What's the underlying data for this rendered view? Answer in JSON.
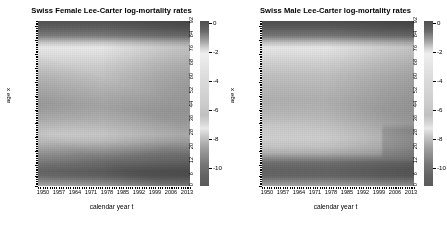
{
  "chart_data": [
    {
      "type": "heatmap",
      "title": "Swiss Female Lee-Carter log-mortality rates",
      "xlabel": "calendar year t",
      "ylabel": "age x",
      "xticks": [
        1950,
        1957,
        1964,
        1971,
        1978,
        1985,
        1992,
        1999,
        2006,
        2013
      ],
      "yticks": [
        0,
        6,
        12,
        20,
        28,
        36,
        44,
        52,
        60,
        68,
        76,
        84,
        92
      ],
      "xlim": [
        1950,
        2016
      ],
      "ylim": [
        0,
        95
      ],
      "zlim": [
        -11,
        0.5
      ],
      "colorbar": {
        "ticks": [
          0,
          -2,
          -4,
          -6,
          -8,
          -10
        ],
        "label": "",
        "position": "right",
        "scale": "log-mortality"
      },
      "grid": false,
      "age_profile": [
        {
          "age": 0,
          "logmu_1950": -4.3,
          "logmu_2016": -6.5
        },
        {
          "age": 6,
          "logmu_1950": -7.8,
          "logmu_2016": -9.6
        },
        {
          "age": 12,
          "logmu_1950": -8.1,
          "logmu_2016": -9.9
        },
        {
          "age": 20,
          "logmu_1950": -7.4,
          "logmu_2016": -9.0
        },
        {
          "age": 28,
          "logmu_1950": -7.2,
          "logmu_2016": -8.7
        },
        {
          "age": 36,
          "logmu_1950": -6.6,
          "logmu_2016": -8.1
        },
        {
          "age": 44,
          "logmu_1950": -5.8,
          "logmu_2016": -7.1
        },
        {
          "age": 52,
          "logmu_1950": -5.0,
          "logmu_2016": -6.1
        },
        {
          "age": 60,
          "logmu_1950": -4.2,
          "logmu_2016": -5.2
        },
        {
          "age": 68,
          "logmu_1950": -3.4,
          "logmu_2016": -4.3
        },
        {
          "age": 76,
          "logmu_1950": -2.5,
          "logmu_2016": -3.3
        },
        {
          "age": 84,
          "logmu_1950": -1.6,
          "logmu_2016": -2.2
        },
        {
          "age": 92,
          "logmu_1950": -0.8,
          "logmu_2016": -1.2
        }
      ]
    },
    {
      "type": "heatmap",
      "title": "Swiss Male Lee-Carter log-mortality rates",
      "xlabel": "calendar year t",
      "ylabel": "age x",
      "xticks": [
        1950,
        1957,
        1964,
        1971,
        1978,
        1985,
        1992,
        1999,
        2006,
        2013
      ],
      "yticks": [
        0,
        6,
        12,
        20,
        28,
        36,
        44,
        52,
        60,
        68,
        76,
        84,
        92
      ],
      "xlim": [
        1950,
        2016
      ],
      "ylim": [
        0,
        95
      ],
      "zlim": [
        -11,
        0.5
      ],
      "colorbar": {
        "ticks": [
          0,
          -2,
          -4,
          -6,
          -8,
          -10
        ],
        "label": "",
        "position": "right",
        "scale": "log-mortality"
      },
      "grid": false,
      "age_profile": [
        {
          "age": 0,
          "logmu_1950": -4.0,
          "logmu_2016": -6.2
        },
        {
          "age": 6,
          "logmu_1950": -7.5,
          "logmu_2016": -9.3
        },
        {
          "age": 12,
          "logmu_1950": -7.9,
          "logmu_2016": -9.5
        },
        {
          "age": 20,
          "logmu_1950": -6.7,
          "logmu_2016": -8.2
        },
        {
          "age": 28,
          "logmu_1950": -6.6,
          "logmu_2016": -8.1
        },
        {
          "age": 36,
          "logmu_1950": -6.2,
          "logmu_2016": -7.6
        },
        {
          "age": 44,
          "logmu_1950": -5.5,
          "logmu_2016": -6.8
        },
        {
          "age": 52,
          "logmu_1950": -4.7,
          "logmu_2016": -5.8
        },
        {
          "age": 60,
          "logmu_1950": -3.9,
          "logmu_2016": -4.9
        },
        {
          "age": 68,
          "logmu_1950": -3.1,
          "logmu_2016": -4.0
        },
        {
          "age": 76,
          "logmu_1950": -2.3,
          "logmu_2016": -3.0
        },
        {
          "age": 84,
          "logmu_1950": -1.5,
          "logmu_2016": -2.0
        },
        {
          "age": 92,
          "logmu_1950": -0.7,
          "logmu_2016": -1.1
        }
      ]
    }
  ],
  "panels": [
    {
      "id": "female",
      "title": "Swiss Female Lee-Carter log-mortality rates",
      "xlabel": "calendar year t",
      "ylabel": "age x",
      "xticks": [
        "1950",
        "1957",
        "1964",
        "1971",
        "1978",
        "1985",
        "1992",
        "1999",
        "2006",
        "2013"
      ],
      "yticks": [
        "0",
        "6",
        "12",
        "20",
        "28",
        "36",
        "44",
        "52",
        "60",
        "68",
        "76",
        "84",
        "92"
      ],
      "cbticks": [
        "0",
        "-2",
        "-4",
        "-6",
        "-8",
        "-10"
      ]
    },
    {
      "id": "male",
      "title": "Swiss Male Lee-Carter log-mortality rates",
      "xlabel": "calendar year t",
      "ylabel": "age x",
      "xticks": [
        "1950",
        "1957",
        "1964",
        "1971",
        "1978",
        "1985",
        "1992",
        "1999",
        "2006",
        "2013"
      ],
      "yticks": [
        "0",
        "6",
        "12",
        "20",
        "28",
        "36",
        "44",
        "52",
        "60",
        "68",
        "76",
        "84",
        "92"
      ],
      "cbticks": [
        "0",
        "-2",
        "-4",
        "-6",
        "-8",
        "-10"
      ]
    }
  ],
  "colors": {
    "background": "#ffffff",
    "text": "#000000",
    "cmap_dark": "#4d4d4d",
    "cmap_light": "#f2f2f2"
  }
}
